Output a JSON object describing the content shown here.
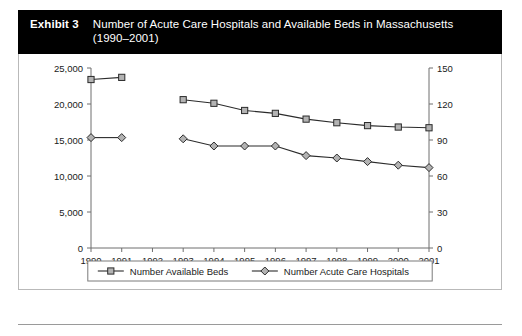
{
  "exhibit": {
    "label": "Exhibit 3",
    "title": "Number of Acute Care Hospitals and Available Beds in Massachusetts (1990–2001)"
  },
  "chart_data": {
    "type": "line",
    "title": "Number of Acute Care Hospitals and Available Beds in Massachusetts (1990–2001)",
    "xlabel": "",
    "ylabel": "",
    "x": [
      1990,
      1991,
      1992,
      1993,
      1994,
      1995,
      1996,
      1997,
      1998,
      1999,
      2000,
      2001
    ],
    "xtick_labels": [
      "1990",
      "1991",
      "1992",
      "1993",
      "1994",
      "1995",
      "1996",
      "1997",
      "1998",
      "1999",
      "2000",
      "2001"
    ],
    "grid": false,
    "legend_position": "bottom",
    "left_axis": {
      "ylim": [
        0,
        25000
      ],
      "ticks": [
        0,
        5000,
        10000,
        15000,
        20000,
        25000
      ],
      "tick_labels": [
        "0",
        "5,000",
        "10,000",
        "15,000",
        "20,000",
        "25,000"
      ]
    },
    "right_axis": {
      "ylim": [
        0,
        150
      ],
      "ticks": [
        0,
        30,
        60,
        90,
        120,
        150
      ],
      "tick_labels": [
        "0",
        "30",
        "60",
        "90",
        "120",
        "150"
      ]
    },
    "series": [
      {
        "name": "Number Available Beds",
        "axis": "left",
        "marker": "square",
        "x": [
          1990,
          1991,
          1993,
          1994,
          1995,
          1996,
          1997,
          1998,
          1999,
          2000,
          2001
        ],
        "values": [
          23400,
          23700,
          20600,
          20100,
          19100,
          18700,
          17900,
          17400,
          17000,
          16800,
          16700
        ]
      },
      {
        "name": "Number Acute Care Hospitals",
        "axis": "right",
        "marker": "diamond",
        "x": [
          1990,
          1991,
          1993,
          1994,
          1995,
          1996,
          1997,
          1998,
          1999,
          2000,
          2001
        ],
        "values": [
          92,
          92,
          91,
          85,
          85,
          85,
          77,
          75,
          72,
          69,
          67
        ]
      }
    ],
    "legend": [
      {
        "label": "Number Available Beds",
        "marker": "square"
      },
      {
        "label": "Number Acute Care Hospitals",
        "marker": "diamond"
      }
    ]
  }
}
